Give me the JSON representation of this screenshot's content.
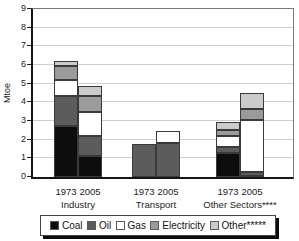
{
  "chart_data": {
    "type": "bar",
    "stacked": true,
    "title": "",
    "xlabel": "",
    "ylabel": "Mtoe",
    "ylim": [
      0,
      9
    ],
    "yticks": [
      0,
      1,
      2,
      3,
      4,
      5,
      6,
      7,
      8,
      9
    ],
    "grid": true,
    "legend_position": "bottom",
    "groups": [
      {
        "label": "Industry",
        "years": [
          "1973",
          "2005"
        ]
      },
      {
        "label": "Transport",
        "years": [
          "1973",
          "2005"
        ]
      },
      {
        "label": "Other Sectors****",
        "years": [
          "1973",
          "2005"
        ]
      }
    ],
    "categories": [
      "Industry 1973",
      "Industry 2005",
      "Transport 1973",
      "Transport 2005",
      "Other Sectors**** 1973",
      "Other Sectors**** 2005"
    ],
    "series": [
      {
        "name": "Coal",
        "color": "#0d0d0d",
        "values": [
          2.75,
          1.15,
          0,
          0,
          1.3,
          0.05
        ]
      },
      {
        "name": "Oil",
        "color": "#5c5c5c",
        "values": [
          1.6,
          1.05,
          1.75,
          1.8,
          0.3,
          0.2
        ]
      },
      {
        "name": "Gas",
        "color": "#ffffff",
        "values": [
          0.85,
          1.3,
          0,
          0.65,
          0.6,
          2.8
        ]
      },
      {
        "name": "Electricity",
        "color": "#9b9b9b",
        "values": [
          0.75,
          0.85,
          0,
          0,
          0.3,
          0.6
        ]
      },
      {
        "name": "Other*****",
        "color": "#cbcbcb",
        "values": [
          0.25,
          0.55,
          0,
          0,
          0.45,
          0.85
        ]
      }
    ],
    "totals": [
      6.2,
      4.9,
      1.75,
      2.45,
      2.95,
      4.5
    ]
  }
}
